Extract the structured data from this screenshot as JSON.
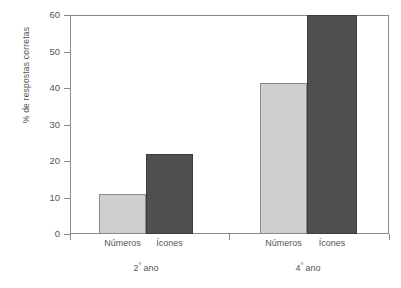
{
  "chart_data": {
    "type": "bar",
    "title": "",
    "xlabel": "",
    "ylabel": "% de respostas corretas",
    "ylim": [
      0,
      60
    ],
    "ytick_labels": [
      "60",
      "50",
      "40",
      "30",
      "20",
      "10",
      "0"
    ],
    "ytick_values": [
      60,
      50,
      40,
      30,
      20,
      10,
      0
    ],
    "grid": false,
    "legend": "none",
    "groups": [
      {
        "label": "2º ano",
        "label_base": "2",
        "label_ordinal": "º",
        "label_suffix": " ano",
        "categories": [
          "Números",
          "Ícones"
        ],
        "values": [
          11,
          22
        ]
      },
      {
        "label": "4º ano",
        "label_base": "4",
        "label_ordinal": "º",
        "label_suffix": " ano",
        "categories": [
          "Números",
          "Ícones"
        ],
        "values": [
          41.5,
          60
        ]
      }
    ],
    "series": [
      {
        "name": "Números",
        "values": [
          11,
          41.5
        ],
        "color": "#cfcfcf"
      },
      {
        "name": "Ícones",
        "values": [
          22,
          60
        ],
        "color": "#4f4f4f"
      }
    ],
    "categories": [
      "2º ano",
      "4º ano"
    ],
    "colors": {
      "numeros": "#cfcfcf",
      "icones": "#4f4f4f",
      "axis": "#8a8a8a",
      "text": "#555555",
      "background": "#ffffff"
    }
  }
}
